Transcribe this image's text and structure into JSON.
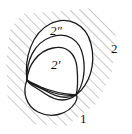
{
  "figure": {
    "kind": "topological-diagram",
    "width": 132,
    "height": 134,
    "background_color": "#ffffff",
    "curve_color": "#1a1a1a",
    "hatch_color": "#9a9a9a",
    "label_color": "#111111",
    "labels": [
      {
        "id": "outer-region",
        "text": "2″",
        "x": 50,
        "y": 24
      },
      {
        "id": "inner-region",
        "text": "2′",
        "x": 51,
        "y": 58
      },
      {
        "id": "right-exterior",
        "text": "2",
        "x": 111,
        "y": 42
      },
      {
        "id": "lower-right",
        "text": "1",
        "x": 80,
        "y": 112
      }
    ],
    "junction_points": [
      {
        "id": "left-junction",
        "x": 27,
        "y": 80
      },
      {
        "id": "right-junction",
        "x": 76,
        "y": 95
      }
    ],
    "curves": [
      {
        "id": "outer-loop",
        "path": "M 27 80 C 24 58 32 33 50 24 C 68 15 86 24 91 44 C 96 64 90 84 76 95 C 66 103 54 100 44 93 C 34 86 29 85 27 80 Z"
      },
      {
        "id": "middle-loop",
        "path": "M 27 80 C 26 61 34 43 51 37 C 67 31 80 40 83 56 C 86 71 83 86 76 95 C 67 99 56 97 46 91 C 36 85 29 84 27 80 Z"
      },
      {
        "id": "inner-upper-loop",
        "path": "M 27 80 C 28 65 38 51 53 48 C 68 45 76 55 77 68 C 78 80 78 89 76 95 C 66 96 55 94 46 90 C 37 86 29 84 27 80 Z"
      },
      {
        "id": "bottom-loop",
        "path": "M 27 80 C 22 92 26 106 38 112 C 52 119 68 114 75 103 C 78 98 77 96 76 95 C 64 94 50 91 41 87 C 33 83 29 82 27 80 Z"
      }
    ],
    "hatching": {
      "angle_deg": -45,
      "spacing": 7,
      "line_width": 1.1,
      "note": "exterior region of the outer loop, clipped to a rounded frame"
    }
  }
}
